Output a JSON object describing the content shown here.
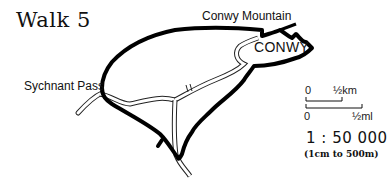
{
  "title": "Walk 5",
  "labels": {
    "conwy_mountain": "Conwy Mountain",
    "conwy": "CONWY",
    "sychnant_pass": "Sychnant Pass"
  },
  "scale": {
    "km_zero": "0",
    "km_half": "½km",
    "mile_zero": "0",
    "mile_half": "½ml",
    "ratio": "1 : 50 000",
    "ratio_note": "(1cm to 500m)"
  },
  "colors": {
    "route": "#000000",
    "road_outline": "#222222",
    "background": "#ffffff"
  }
}
